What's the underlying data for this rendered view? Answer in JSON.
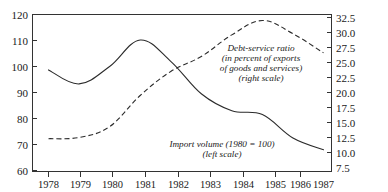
{
  "chart_data": {
    "type": "line",
    "title": "",
    "subtitle": "",
    "xlabel": "",
    "ylabel": "",
    "grid": false,
    "legend_position": "inline-annotation",
    "x": [
      1978,
      1979,
      1980,
      1981,
      1982,
      1983,
      1984,
      1985,
      1986,
      1987
    ],
    "x_tick_labels": [
      "1978",
      "1979",
      "1980",
      "1981",
      "1982",
      "1983",
      "1984",
      "1985",
      "1986",
      "1987"
    ],
    "left_axis": {
      "label": "Import volume (1980 = 100)",
      "ticks": [
        60,
        70,
        80,
        90,
        100,
        110,
        120
      ],
      "tick_labels": [
        "60",
        "70",
        "80",
        "90",
        "100",
        "110",
        "120"
      ],
      "ylim": [
        60,
        120
      ]
    },
    "right_axis": {
      "label": "Debt-service ratio (in percent of exports of goods and services)",
      "ticks": [
        7.5,
        10.0,
        12.5,
        15.0,
        17.5,
        20.0,
        22.5,
        25.0,
        27.5,
        30.0,
        32.5
      ],
      "tick_labels": [
        "7.5",
        "10.0",
        "12.5",
        "15.0",
        "17.5",
        "20.0",
        "22.5",
        "25.0",
        "27.5",
        "30.0",
        "32.5"
      ],
      "ylim": [
        7.5,
        32.5
      ]
    },
    "series": [
      {
        "name": "Import volume (1980 = 100)",
        "scale": "left",
        "style": "solid",
        "values": [
          98.7,
          93.3,
          100.0,
          110.2,
          102.0,
          89.5,
          83.0,
          81.5,
          72.5,
          68.0
        ]
      },
      {
        "name": "Debt-service ratio (in percent of exports of goods and services)",
        "scale": "right",
        "style": "dashed",
        "values": [
          12.3,
          12.5,
          14.3,
          19.5,
          23.5,
          26.0,
          29.6,
          32.0,
          29.8,
          26.6
        ]
      }
    ],
    "annotations": [
      {
        "id": "debt-service-annotation",
        "lines": [
          "Debt-service ratio",
          "(in percent of exports",
          "of goods and services)",
          "(right scale)"
        ],
        "x": 260,
        "y": 46
      },
      {
        "id": "import-volume-annotation",
        "lines": [
          "Import volume (1980 = 100)",
          "(left scale)"
        ],
        "x": 222,
        "y": 146
      }
    ]
  },
  "axes": {
    "left_ticks": [
      "120",
      "110",
      "100",
      "90",
      "80",
      "70",
      "60"
    ],
    "right_ticks": [
      "32.5",
      "30.0",
      "27.5",
      "25.0",
      "22.5",
      "20.0",
      "17.5",
      "15.0",
      "12.5",
      "10.0",
      "7.5"
    ],
    "x_ticks": [
      "1978",
      "1979",
      "1980",
      "1981",
      "1982",
      "1983",
      "1984",
      "1985",
      "1986",
      "1987"
    ]
  },
  "annotations": {
    "debt": {
      "line1": "Debt-service ratio",
      "line2": "(in percent of exports",
      "line3": "of goods and services)",
      "line4": "(right scale)"
    },
    "imports": {
      "line1": "Import volume (1980  =  100)",
      "line2": "(left scale)"
    }
  },
  "colors": {
    "line": "#2b2b2b",
    "axis": "#333333",
    "background": "#ffffff"
  }
}
